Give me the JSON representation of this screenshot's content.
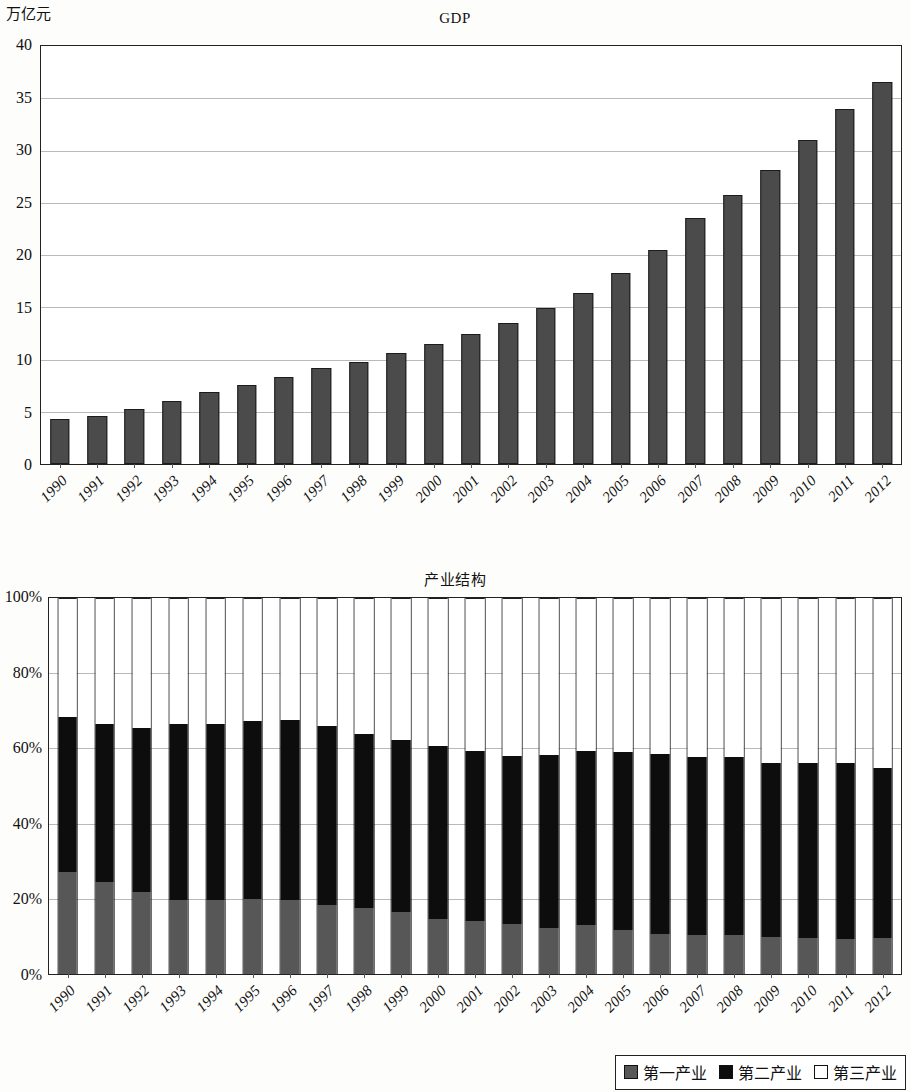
{
  "chart_data": [
    {
      "type": "bar",
      "title": "GDP",
      "ylabel": "万亿元",
      "xlabel": "",
      "ylim": [
        0,
        40
      ],
      "ytick_step": 5,
      "yticks": [
        "0",
        "5",
        "10",
        "15",
        "20",
        "25",
        "30",
        "35",
        "40"
      ],
      "grid": true,
      "legend": "none",
      "bar_color": "#4b4b4b",
      "categories": [
        "1990",
        "1991",
        "1992",
        "1993",
        "1994",
        "1995",
        "1996",
        "1997",
        "1998",
        "1999",
        "2000",
        "2001",
        "2002",
        "2003",
        "2004",
        "2005",
        "2006",
        "2007",
        "2008",
        "2009",
        "2010",
        "2011",
        "2012"
      ],
      "values": [
        4.3,
        4.6,
        5.3,
        6.0,
        6.9,
        7.6,
        8.3,
        9.2,
        9.8,
        10.6,
        11.5,
        12.4,
        13.5,
        14.9,
        16.4,
        18.3,
        20.5,
        23.5,
        25.7,
        28.1,
        31.0,
        34.0,
        36.6
      ]
    },
    {
      "type": "bar",
      "subtype": "stacked-percent",
      "title": "产业结构",
      "ylabel": "",
      "xlabel": "",
      "ylim": [
        0,
        100
      ],
      "ytick_step": 20,
      "yticks": [
        "0%",
        "20%",
        "40%",
        "60%",
        "80%",
        "100%"
      ],
      "grid": true,
      "legend": "bottom-right",
      "categories": [
        "1990",
        "1991",
        "1992",
        "1993",
        "1994",
        "1995",
        "1996",
        "1997",
        "1998",
        "1999",
        "2000",
        "2001",
        "2002",
        "2003",
        "2004",
        "2005",
        "2006",
        "2007",
        "2008",
        "2009",
        "2010",
        "2011",
        "2012"
      ],
      "series": [
        {
          "name": "第一产业",
          "color": "#575757",
          "values": [
            27.1,
            24.5,
            21.8,
            19.7,
            19.6,
            19.9,
            19.7,
            18.3,
            17.6,
            16.5,
            14.7,
            14.0,
            13.3,
            12.3,
            13.0,
            11.6,
            10.6,
            10.3,
            10.3,
            9.8,
            9.5,
            9.4,
            9.5
          ]
        },
        {
          "name": "第二产业",
          "color": "#0d0d0d",
          "values": [
            41.2,
            41.9,
            43.7,
            46.8,
            47.0,
            47.4,
            47.8,
            47.6,
            46.2,
            45.8,
            45.9,
            45.2,
            44.8,
            46.0,
            46.2,
            47.4,
            48.0,
            47.3,
            47.5,
            46.2,
            46.7,
            46.6,
            45.3
          ]
        },
        {
          "name": "第三产业",
          "color": "#ffffff",
          "values": [
            31.7,
            33.6,
            34.5,
            33.5,
            33.4,
            32.7,
            32.5,
            34.1,
            36.2,
            37.7,
            39.4,
            40.8,
            41.9,
            41.7,
            40.8,
            41.0,
            41.4,
            42.4,
            42.2,
            44.0,
            43.8,
            44.0,
            45.2
          ]
        }
      ]
    }
  ],
  "chart1": {
    "title": "GDP",
    "unit": "万亿元",
    "yticks": [
      "40",
      "35",
      "30",
      "25",
      "20",
      "15",
      "10",
      "5",
      "0"
    ]
  },
  "chart2": {
    "title": "产业结构",
    "yticks": [
      "100%",
      "80%",
      "60%",
      "40%",
      "20%",
      "0%"
    ],
    "legend": [
      {
        "label": "第一产业",
        "swatch": "sw-a"
      },
      {
        "label": "第二产业",
        "swatch": "sw-b"
      },
      {
        "label": "第三产业",
        "swatch": "sw-c"
      }
    ]
  }
}
